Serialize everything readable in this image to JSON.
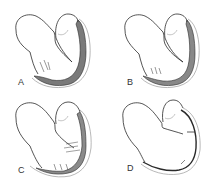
{
  "figure": {
    "panels": [
      {
        "id": "A",
        "label": "A",
        "wall": "thick"
      },
      {
        "id": "B",
        "label": "B",
        "wall": "moderate"
      },
      {
        "id": "C",
        "label": "C",
        "wall": "thin"
      },
      {
        "id": "D",
        "label": "D",
        "wall": "very-thin"
      }
    ],
    "colors": {
      "outline": "#2a2a2a",
      "myocardium": "#7a7a7a",
      "pericardium": "#9a9a9a",
      "background": "#ffffff"
    }
  }
}
